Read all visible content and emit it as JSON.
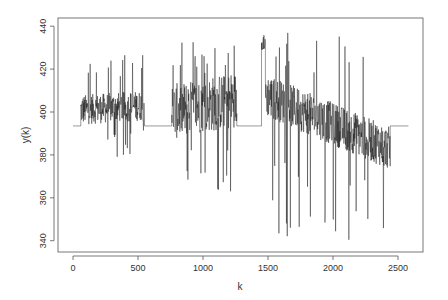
{
  "chart_data": {
    "type": "line",
    "title": "",
    "xlabel": "k",
    "ylabel": "y(k)",
    "xlim": [
      -100,
      2700
    ],
    "ylim": [
      336,
      443
    ],
    "x_ticks": [
      0,
      500,
      1000,
      1500,
      2000,
      2500
    ],
    "x_tick_labels": [
      "0",
      "500",
      "1000",
      "1500",
      "2000",
      "2500"
    ],
    "y_ticks": [
      340,
      360,
      380,
      400,
      420,
      440
    ],
    "y_tick_labels": [
      "340",
      "360",
      "380",
      "400",
      "420",
      "440"
    ],
    "grid": false,
    "legend": null,
    "line_color": "#111111",
    "series": [
      {
        "name": "y(k)",
        "segments": [
          {
            "k_start": 0,
            "k_end": 60,
            "kind": "flat",
            "level": 393.5
          },
          {
            "k_start": 60,
            "k_end": 550,
            "kind": "noisy",
            "mean_start": 401,
            "mean_end": 403,
            "amp": 7,
            "spike_max": 428.5,
            "spike_min": 379
          },
          {
            "k_start": 550,
            "k_end": 760,
            "kind": "flat",
            "level": 393.5
          },
          {
            "k_start": 760,
            "k_end": 1260,
            "kind": "noisy",
            "mean_start": 400,
            "mean_end": 406,
            "amp": 13,
            "spike_max": 433,
            "spike_min": 361
          },
          {
            "k_start": 1260,
            "k_end": 1450,
            "kind": "flat",
            "level": 393.5
          },
          {
            "k_start": 1450,
            "k_end": 1480,
            "kind": "noisy",
            "mean_start": 433,
            "mean_end": 433,
            "amp": 4,
            "spike_max": 439,
            "spike_min": 428
          },
          {
            "k_start": 1480,
            "k_end": 2440,
            "kind": "noisy",
            "mean_start": 408,
            "mean_end": 383,
            "amp": 10,
            "spike_max": 438,
            "spike_min": 340
          },
          {
            "k_start": 2440,
            "k_end": 2580,
            "kind": "flat",
            "level": 393.5
          }
        ]
      }
    ]
  }
}
